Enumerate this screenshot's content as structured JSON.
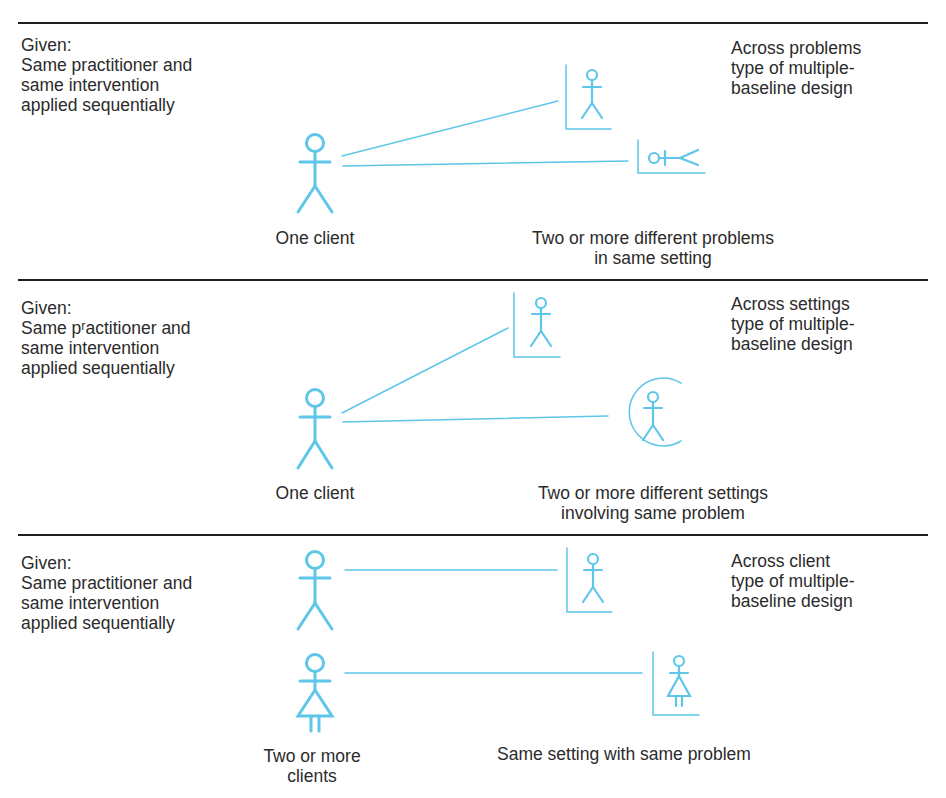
{
  "panels": [
    {
      "given_label": "Given:",
      "given_text": "Same practitioner and\nsame intervention\napplied sequentially",
      "design_type": "Across problems\ntype of multiple-\nbaseline design",
      "left_caption": "One client",
      "right_caption": "Two or more different problems\nin same setting",
      "left_icons": [
        "stick-figure-male"
      ],
      "right_icons": [
        "framed-figure-standing",
        "framed-figure-lying"
      ]
    },
    {
      "given_label": "Given:",
      "given_text": "Same pʳactitioner and\nsame intervention\napplied sequentially",
      "design_type": "Across settings\ntype of multiple-\nbaseline design",
      "left_caption": "One client",
      "right_caption": "Two or more different settings\ninvolving same problem",
      "left_icons": [
        "stick-figure-male"
      ],
      "right_icons": [
        "framed-figure-standing",
        "circled-figure-standing"
      ]
    },
    {
      "given_label": "Given:",
      "given_text": "Same practitioner and\nsame intervention\napplied sequentially",
      "design_type": "Across client\ntype of multiple-\nbaseline design",
      "left_caption": "Two or more\nclients",
      "right_caption": "Same setting with same problem",
      "left_icons": [
        "stick-figure-male",
        "stick-figure-female"
      ],
      "right_icons": [
        "framed-figure-male",
        "framed-figure-female"
      ]
    }
  ],
  "colors": {
    "figure": "#5ec6e8",
    "rule": "#1e1e1e",
    "text": "#2b2b2b"
  }
}
